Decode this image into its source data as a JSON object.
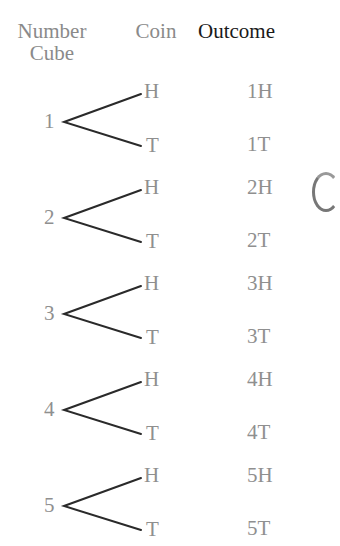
{
  "headers": {
    "number_cube_line1": "Number",
    "number_cube_line2": "Cube",
    "coin": "Coin",
    "outcome": "Outcome"
  },
  "tree": [
    {
      "cube": "1",
      "heads": "H",
      "tails": "T",
      "outcome_h": "1H",
      "outcome_t": "1T"
    },
    {
      "cube": "2",
      "heads": "H",
      "tails": "T",
      "outcome_h": "2H",
      "outcome_t": "2T"
    },
    {
      "cube": "3",
      "heads": "H",
      "tails": "T",
      "outcome_h": "3H",
      "outcome_t": "3T"
    },
    {
      "cube": "4",
      "heads": "H",
      "tails": "T",
      "outcome_h": "4H",
      "outcome_t": "4T"
    },
    {
      "cube": "5",
      "heads": "H",
      "tails": "T",
      "outcome_h": "5H",
      "outcome_t": "5T"
    }
  ],
  "colors": {
    "header_muted": "#8a8a8a",
    "header_emphasis": "#1a1a1a",
    "labels": "#8f8f8f",
    "branch_lines": "#2a2a2a"
  }
}
